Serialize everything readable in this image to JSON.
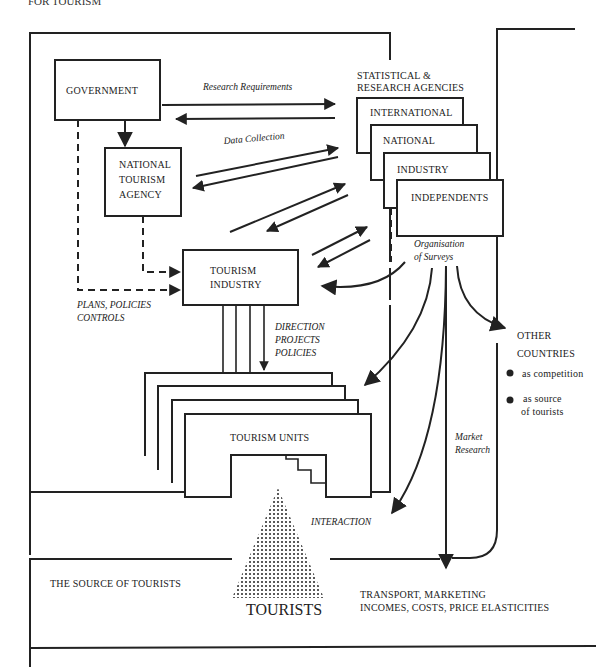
{
  "figure": {
    "heading": "FOR TOURISM"
  },
  "nodes": {
    "government": "GOVERNMENT",
    "nta": [
      "NATIONAL",
      "TOURISM",
      "AGENCY"
    ],
    "industry": [
      "TOURISM",
      "INDUSTRY"
    ],
    "agencies_title": [
      "STATISTICAL &",
      "RESEARCH AGENCIES"
    ],
    "agencies": [
      "INTERNATIONAL",
      "NATIONAL",
      "INDUSTRY",
      "INDEPENDENTS"
    ],
    "units": "TOURISM   UNITS",
    "tourists": "TOURISTS",
    "other_countries": {
      "title": [
        "OTHER",
        "COUNTRIES"
      ],
      "bullets": [
        [
          "as competition"
        ],
        [
          "as source",
          "of tourists"
        ]
      ]
    }
  },
  "labels": {
    "research_requirements": "Research Requirements",
    "data_collection": "Data Collection",
    "organisation": [
      "Organisation",
      "of Surveys"
    ],
    "plans": [
      "PLANS, POLICIES",
      "CONTROLS"
    ],
    "direction": [
      "DIRECTION",
      "PROJECTS",
      "POLICIES"
    ],
    "market_research": [
      "Market",
      "Research"
    ],
    "interaction": "INTERACTION",
    "source_of_tourists": "THE SOURCE OF TOURISTS",
    "transport": [
      "TRANSPORT, MARKETING",
      "INCOMES, COSTS, PRICE ELASTICITIES"
    ]
  }
}
